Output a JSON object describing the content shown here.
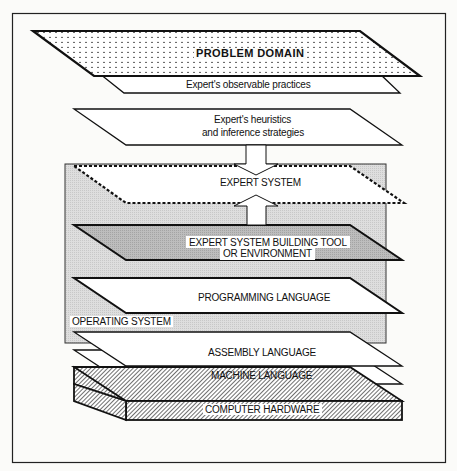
{
  "diagram": {
    "layers": [
      {
        "id": "problem_domain",
        "label": "PROBLEM DOMAIN",
        "fill": "dotted"
      },
      {
        "id": "observable_practices",
        "label": "Expert's observable practices",
        "fill": "#ffffff"
      },
      {
        "id": "heuristics",
        "label_line1": "Expert's  heuristics",
        "label_line2": "and inference strategies",
        "fill": "#ffffff"
      },
      {
        "id": "expert_system",
        "label": "EXPERT SYSTEM",
        "fill": "dashed-outline"
      },
      {
        "id": "building_tool",
        "label_line1": "EXPERT SYSTEM BUILDING TOOL",
        "label_line2": "OR ENVIRONMENT",
        "fill": "#b8b8b8"
      },
      {
        "id": "programming_language",
        "label": "PROGRAMMING LANGUAGE",
        "fill": "#ffffff"
      },
      {
        "id": "operating_system",
        "label": "OPERATING SYSTEM",
        "fill": "#dcdcdc"
      },
      {
        "id": "assembly_language",
        "label": "ASSEMBLY LANGUAGE",
        "fill": "#ffffff"
      },
      {
        "id": "machine_language",
        "label": "MACHINE LANGUAGE",
        "fill": "#ffffff"
      },
      {
        "id": "computer_hardware",
        "label": "COMPUTER HARDWARE",
        "fill": "hatched"
      }
    ],
    "arrows": [
      {
        "from": "heuristics",
        "to": "expert_system",
        "direction": "down"
      },
      {
        "from": "building_tool",
        "to": "expert_system",
        "direction": "up"
      }
    ],
    "colors": {
      "stroke": "#111111",
      "background": "#fbfbf9",
      "os_box": "#dcdcdc",
      "tool_layer": "#b8b8b8"
    }
  }
}
